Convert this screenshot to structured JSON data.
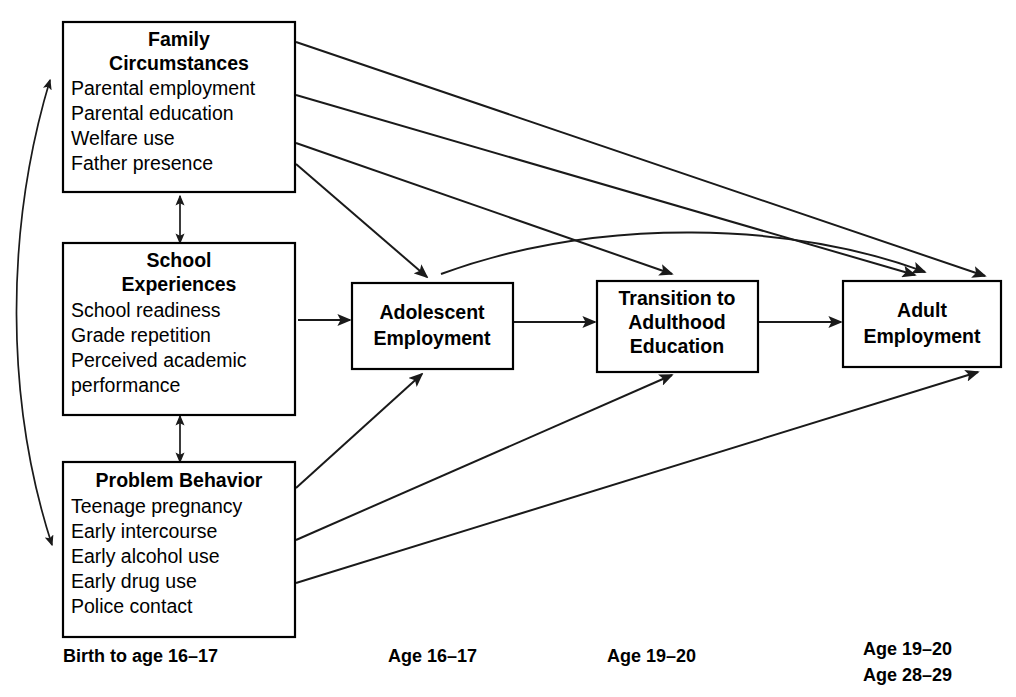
{
  "diagram": {
    "type": "flow-diagram",
    "background_color": "#ffffff",
    "line_color": "#1a1a1a",
    "text_color": "#000000"
  },
  "nodes": {
    "family": {
      "id": "family-circumstances",
      "title_line1": "Family",
      "title_line2": "Circumstances",
      "items": [
        "Parental employment",
        "Parental education",
        "Welfare use",
        "Father presence"
      ]
    },
    "school": {
      "id": "school-experiences",
      "title_line1": "School",
      "title_line2": "Experiences",
      "items": [
        "School readiness",
        "Grade repetition",
        "Perceived academic",
        "performance"
      ]
    },
    "problem": {
      "id": "problem-behavior",
      "title_line1": "Problem Behavior",
      "title_line2": "",
      "items": [
        "Teenage pregnancy",
        "Early intercourse",
        "Early alcohol use",
        "Early drug use",
        "Police contact"
      ]
    },
    "adolescent": {
      "id": "adolescent-employment",
      "lines": [
        "Adolescent",
        "Employment"
      ]
    },
    "transition": {
      "id": "transition-to-adulthood-education",
      "lines": [
        "Transition to",
        "Adulthood",
        "Education"
      ]
    },
    "adult": {
      "id": "adult-employment",
      "lines": [
        "Adult",
        "Employment"
      ]
    }
  },
  "timeline_labels": [
    {
      "id": "birth-to-16-17",
      "text": "Birth to age 16–17"
    },
    {
      "id": "age-16-17",
      "text": "Age 16–17"
    },
    {
      "id": "age-19-20",
      "text": "Age 19–20"
    },
    {
      "id": "age-19-20-adult",
      "text": "Age 19–20"
    },
    {
      "id": "age-28-29-adult",
      "text": "Age 28–29"
    }
  ],
  "edges": [
    {
      "id": "family-to-adult",
      "from": "family-circumstances",
      "to": "adult-employment",
      "style": "straight",
      "arrow": "single"
    },
    {
      "id": "family-to-transition",
      "from": "family-circumstances",
      "to": "transition-to-adulthood-education",
      "style": "straight",
      "arrow": "single"
    },
    {
      "id": "family-to-adolescent",
      "from": "family-circumstances",
      "to": "adolescent-employment",
      "style": "straight",
      "arrow": "single"
    },
    {
      "id": "family-school-bidirectional",
      "from": "family-circumstances",
      "to": "school-experiences",
      "style": "straight",
      "arrow": "double"
    },
    {
      "id": "school-problem-bidirectional",
      "from": "school-experiences",
      "to": "problem-behavior",
      "style": "straight",
      "arrow": "double"
    },
    {
      "id": "family-problem-bidirectional",
      "from": "family-circumstances",
      "to": "problem-behavior",
      "style": "curved",
      "arrow": "double"
    },
    {
      "id": "school-to-adolescent",
      "from": "school-experiences",
      "to": "adolescent-employment",
      "style": "straight",
      "arrow": "single"
    },
    {
      "id": "problem-to-adolescent",
      "from": "problem-behavior",
      "to": "adolescent-employment",
      "style": "straight",
      "arrow": "single"
    },
    {
      "id": "problem-to-transition",
      "from": "problem-behavior",
      "to": "transition-to-adulthood-education",
      "style": "straight",
      "arrow": "single"
    },
    {
      "id": "problem-to-adult",
      "from": "problem-behavior",
      "to": "adult-employment",
      "style": "straight",
      "arrow": "single"
    },
    {
      "id": "adolescent-to-transition",
      "from": "adolescent-employment",
      "to": "transition-to-adulthood-education",
      "style": "straight",
      "arrow": "single"
    },
    {
      "id": "transition-to-adult",
      "from": "transition-to-adulthood-education",
      "to": "adult-employment",
      "style": "straight",
      "arrow": "single"
    },
    {
      "id": "adolescent-to-adult-curved",
      "from": "adolescent-employment",
      "to": "adult-employment",
      "style": "curved",
      "arrow": "single"
    }
  ]
}
